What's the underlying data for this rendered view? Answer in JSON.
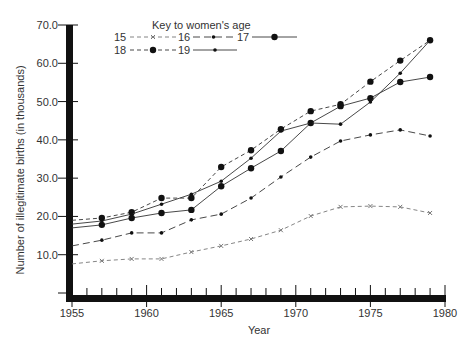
{
  "chart_data": {
    "type": "line",
    "title": "",
    "xlabel": "Year",
    "ylabel": "Number of illegitimate births (in thousands)",
    "xlim": [
      1955,
      1980
    ],
    "ylim": [
      0,
      70
    ],
    "grid": false,
    "x_ticks": [
      "1955",
      "1960",
      "1965",
      "1970",
      "1975",
      "1980"
    ],
    "y_ticks": [
      "10.0",
      "20.0",
      "30.0",
      "40.0",
      "50.0",
      "60.0",
      "70.0"
    ],
    "legend": {
      "title": "Key to women's age",
      "position": "top-left-inside",
      "entries": [
        "15",
        "16",
        "17",
        "18",
        "19"
      ]
    },
    "x": [
      1955,
      1957,
      1959,
      1961,
      1963,
      1965,
      1967,
      1969,
      1971,
      1973,
      1975,
      1977,
      1979
    ],
    "series": [
      {
        "name": "15",
        "style": "dashed",
        "marker": "x",
        "values": [
          7.6,
          8.4,
          8.9,
          8.9,
          10.7,
          12.3,
          14.1,
          16.4,
          20.1,
          22.5,
          22.7,
          22.5,
          20.9
        ]
      },
      {
        "name": "16",
        "style": "dash-dot",
        "marker": "small-dot",
        "values": [
          12.3,
          13.8,
          15.7,
          15.7,
          19.1,
          20.6,
          24.8,
          30.3,
          35.5,
          39.7,
          41.3,
          42.6,
          41.0
        ]
      },
      {
        "name": "17",
        "style": "solid",
        "marker": "large-dot",
        "values": [
          17.0,
          17.8,
          19.6,
          20.9,
          21.7,
          27.9,
          32.6,
          37.1,
          44.4,
          48.8,
          50.9,
          55.1,
          56.4
        ]
      },
      {
        "name": "18",
        "style": "dashed",
        "marker": "large-dot",
        "values": [
          19.0,
          19.6,
          21.1,
          24.8,
          24.8,
          32.9,
          37.3,
          42.8,
          47.5,
          49.3,
          55.2,
          60.7,
          66.0
        ]
      },
      {
        "name": "19",
        "style": "solid",
        "marker": "small-dot",
        "values": [
          18.0,
          18.8,
          20.6,
          23.2,
          25.8,
          29.2,
          35.2,
          42.3,
          44.4,
          44.1,
          49.9,
          57.4,
          66.0
        ]
      }
    ]
  },
  "colors": {
    "axis": "#111111",
    "line": "#333333",
    "text": "#333333"
  }
}
